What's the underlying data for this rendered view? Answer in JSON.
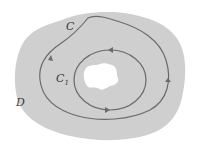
{
  "diagram": {
    "region_label": "D",
    "outer_curve_label": "C",
    "inner_curve_label": "C",
    "inner_curve_subscript": "1",
    "colors": {
      "region_fill": "#cfcfcf",
      "hole_fill": "#ffffff",
      "curve_stroke": "#6a6a6a",
      "background": "#ffffff"
    }
  }
}
